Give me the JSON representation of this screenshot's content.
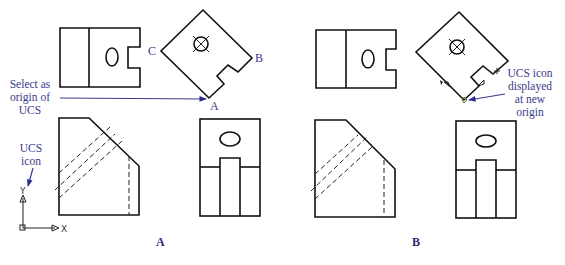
{
  "figure": {
    "panels": [
      {
        "id": "A",
        "caption": "A",
        "points": {
          "a": "A",
          "b": "B",
          "c": "C"
        },
        "callouts": {
          "select_origin": [
            "Select as",
            "origin of",
            "UCS"
          ],
          "ucs_icon": [
            "UCS",
            "icon"
          ]
        },
        "ucs_axes": {
          "x": "X",
          "y": "Y"
        }
      },
      {
        "id": "B",
        "caption": "B",
        "callouts": {
          "ucs_new_origin": [
            "UCS icon",
            "displayed",
            "at new",
            "origin"
          ]
        }
      }
    ],
    "colors": {
      "line": "#111111",
      "label": "#3a3a8c",
      "arrow": "#2a2a8c",
      "background": "#ffffff"
    }
  }
}
